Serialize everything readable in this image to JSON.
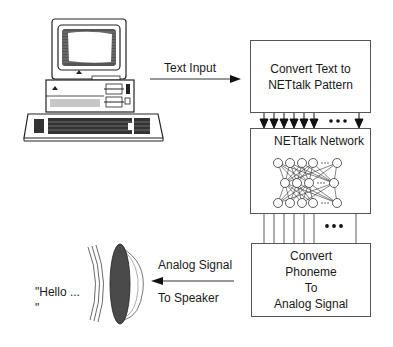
{
  "diagram": {
    "nodes": {
      "computer": {
        "icon": "desktop-computer-icon"
      },
      "convert_text": {
        "lines": [
          "Convert Text to",
          "NETtalk Pattern"
        ]
      },
      "network": {
        "title": "NETtalk Network",
        "layers": [
          5,
          4,
          5
        ],
        "ellipsis": "..."
      },
      "convert_phoneme": {
        "lines": [
          "Convert",
          "Phoneme",
          "To",
          "Analog Signal"
        ]
      },
      "speaker": {
        "icon": "speaker-icon"
      },
      "output_speech": {
        "line1": "\"Hello ...",
        "line2": "\""
      }
    },
    "edges": {
      "text_input": {
        "label": "Text Input"
      },
      "analog_signal": {
        "label_top": "Analog Signal",
        "label_bottom": "To Speaker"
      },
      "pattern_to_network": {
        "ellipsis": "•••"
      },
      "network_to_phoneme": {
        "ellipsis": "•••"
      }
    },
    "colors": {
      "line": "#333333",
      "speaker_fill": "#4a4a4a",
      "text": "#1a1a1a"
    }
  }
}
